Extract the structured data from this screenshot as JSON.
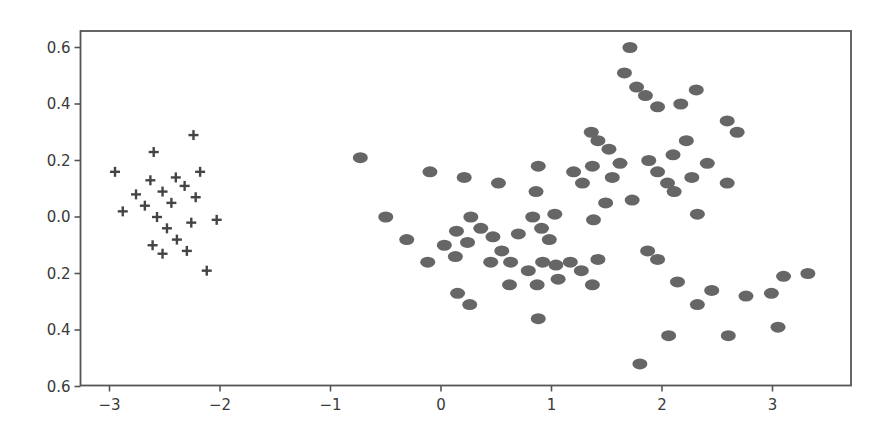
{
  "chart_data": {
    "type": "scatter",
    "title": "",
    "xlabel": "",
    "ylabel": "",
    "xlim": [
      -3.28,
      3.7
    ],
    "ylim": [
      -0.6,
      0.66
    ],
    "grid": false,
    "legend": null,
    "x_ticks": [
      -3,
      -2,
      -1,
      0,
      1,
      2,
      3
    ],
    "x_tick_labels": [
      "−3",
      "−2",
      "−1",
      "0",
      "1",
      "2",
      "3"
    ],
    "y_ticks": [
      0.6,
      0.4,
      0.2,
      0.0,
      -0.2,
      -0.4,
      -0.6
    ],
    "y_tick_labels": [
      "0.6",
      "0.4",
      "0.2",
      "0.0",
      "0.2",
      "0.4",
      "0.6"
    ],
    "series": [
      {
        "name": "cluster-crosses",
        "marker": "plus",
        "color": "#444444",
        "points": [
          [
            -2.24,
            0.29
          ],
          [
            -2.6,
            0.23
          ],
          [
            -2.95,
            0.16
          ],
          [
            -2.18,
            0.16
          ],
          [
            -2.63,
            0.13
          ],
          [
            -2.4,
            0.14
          ],
          [
            -2.32,
            0.11
          ],
          [
            -2.52,
            0.09
          ],
          [
            -2.76,
            0.08
          ],
          [
            -2.22,
            0.07
          ],
          [
            -2.44,
            0.05
          ],
          [
            -2.68,
            0.04
          ],
          [
            -2.88,
            0.02
          ],
          [
            -2.57,
            0.0
          ],
          [
            -2.03,
            -0.01
          ],
          [
            -2.26,
            -0.02
          ],
          [
            -2.48,
            -0.04
          ],
          [
            -2.39,
            -0.08
          ],
          [
            -2.61,
            -0.1
          ],
          [
            -2.3,
            -0.12
          ],
          [
            -2.52,
            -0.13
          ],
          [
            -2.12,
            -0.19
          ]
        ]
      },
      {
        "name": "cluster-dots",
        "marker": "circle",
        "color": "#666666",
        "points": [
          [
            -0.73,
            0.21
          ],
          [
            -0.1,
            0.16
          ],
          [
            0.21,
            0.14
          ],
          [
            0.52,
            0.12
          ],
          [
            -0.5,
            0.0
          ],
          [
            -0.31,
            -0.08
          ],
          [
            -0.12,
            -0.16
          ],
          [
            0.03,
            -0.1
          ],
          [
            0.14,
            -0.05
          ],
          [
            0.27,
            0.0
          ],
          [
            0.36,
            -0.04
          ],
          [
            0.24,
            -0.09
          ],
          [
            0.13,
            -0.14
          ],
          [
            0.47,
            -0.07
          ],
          [
            0.55,
            -0.12
          ],
          [
            0.63,
            -0.16
          ],
          [
            0.45,
            -0.16
          ],
          [
            0.7,
            -0.06
          ],
          [
            0.79,
            -0.19
          ],
          [
            0.92,
            -0.16
          ],
          [
            0.87,
            -0.24
          ],
          [
            0.62,
            -0.24
          ],
          [
            0.15,
            -0.27
          ],
          [
            0.26,
            -0.31
          ],
          [
            0.88,
            -0.36
          ],
          [
            0.83,
            0.0
          ],
          [
            0.91,
            -0.04
          ],
          [
            0.98,
            -0.08
          ],
          [
            1.04,
            -0.17
          ],
          [
            1.06,
            -0.22
          ],
          [
            1.17,
            -0.16
          ],
          [
            1.27,
            -0.19
          ],
          [
            1.37,
            -0.24
          ],
          [
            1.42,
            -0.15
          ],
          [
            0.86,
            0.09
          ],
          [
            0.88,
            0.18
          ],
          [
            1.03,
            0.01
          ],
          [
            1.38,
            -0.01
          ],
          [
            1.49,
            0.05
          ],
          [
            1.73,
            0.06
          ],
          [
            1.2,
            0.16
          ],
          [
            1.28,
            0.12
          ],
          [
            1.36,
            0.3
          ],
          [
            1.42,
            0.27
          ],
          [
            1.52,
            0.24
          ],
          [
            1.55,
            0.14
          ],
          [
            1.62,
            0.19
          ],
          [
            1.37,
            0.18
          ],
          [
            1.71,
            0.6
          ],
          [
            1.66,
            0.51
          ],
          [
            1.77,
            0.46
          ],
          [
            1.85,
            0.43
          ],
          [
            1.96,
            0.39
          ],
          [
            2.17,
            0.4
          ],
          [
            2.31,
            0.45
          ],
          [
            1.88,
            0.2
          ],
          [
            1.96,
            0.16
          ],
          [
            2.1,
            0.22
          ],
          [
            2.22,
            0.27
          ],
          [
            2.05,
            0.12
          ],
          [
            2.11,
            0.09
          ],
          [
            2.27,
            0.14
          ],
          [
            2.41,
            0.19
          ],
          [
            2.32,
            0.01
          ],
          [
            2.59,
            0.12
          ],
          [
            2.59,
            0.34
          ],
          [
            2.68,
            0.3
          ],
          [
            1.87,
            -0.12
          ],
          [
            1.96,
            -0.15
          ],
          [
            2.14,
            -0.23
          ],
          [
            2.45,
            -0.26
          ],
          [
            2.32,
            -0.31
          ],
          [
            2.76,
            -0.28
          ],
          [
            2.99,
            -0.27
          ],
          [
            3.1,
            -0.21
          ],
          [
            3.32,
            -0.2
          ],
          [
            2.06,
            -0.42
          ],
          [
            2.6,
            -0.42
          ],
          [
            3.05,
            -0.39
          ],
          [
            1.8,
            -0.52
          ]
        ]
      }
    ]
  }
}
